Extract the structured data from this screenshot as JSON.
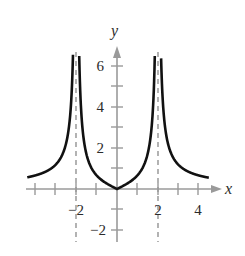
{
  "chart_data": {
    "type": "line",
    "title": "",
    "xlabel": "x",
    "ylabel": "y",
    "xlim": [
      -4.5,
      4.8
    ],
    "ylim": [
      -2.5,
      7
    ],
    "x_ticks": [
      -4,
      -3,
      -2,
      -1,
      1,
      2,
      3,
      4
    ],
    "x_tick_labels": [
      "-2",
      "2",
      "4"
    ],
    "x_tick_label_values": [
      -2,
      2,
      4
    ],
    "y_ticks": [
      -2,
      -1,
      1,
      2,
      3,
      4,
      5,
      6
    ],
    "y_tick_labels": [
      "6",
      "4",
      "2",
      "-2"
    ],
    "y_tick_label_values": [
      6,
      4,
      2,
      -2
    ],
    "grid": false,
    "legend": null,
    "asymptotes": [
      {
        "type": "vertical",
        "x": -2,
        "style": "dashed"
      },
      {
        "type": "vertical",
        "x": 2,
        "style": "dashed"
      }
    ],
    "series": [
      {
        "name": "f(x)",
        "description": "even function with cusp at origin, vertical asymptotes at x = ±2, approaching 0 as |x| grows",
        "approx_formula": "2|x| / |x^2 - 4|",
        "points": [
          [
            -4.4,
            0.6
          ],
          [
            -4.0,
            0.67
          ],
          [
            -3.5,
            0.85
          ],
          [
            -3.0,
            1.2
          ],
          [
            -2.6,
            1.9
          ],
          [
            -2.3,
            3.4
          ],
          [
            -2.15,
            6.6
          ],
          [
            -1.85,
            6.6
          ],
          [
            -1.7,
            4.3
          ],
          [
            -1.5,
            1.7
          ],
          [
            -1.0,
            0.67
          ],
          [
            -0.5,
            0.27
          ],
          [
            0,
            0
          ],
          [
            0.5,
            0.27
          ],
          [
            1.0,
            0.67
          ],
          [
            1.5,
            1.7
          ],
          [
            1.7,
            4.3
          ],
          [
            1.85,
            6.6
          ],
          [
            2.15,
            6.6
          ],
          [
            2.3,
            3.4
          ],
          [
            2.6,
            1.9
          ],
          [
            3.0,
            1.2
          ],
          [
            3.5,
            0.85
          ],
          [
            4.0,
            0.67
          ],
          [
            4.5,
            0.6
          ]
        ]
      }
    ]
  },
  "labels": {
    "x_axis": "x",
    "y_axis": "y",
    "xtick_neg2": "−2",
    "xtick_2": "2",
    "xtick_4": "4",
    "ytick_6": "6",
    "ytick_4": "4",
    "ytick_2": "2",
    "ytick_neg2": "−2"
  },
  "colors": {
    "curve": "#111111",
    "axis": "#9a9a9a",
    "asymptote": "#8a8a8a",
    "text": "#2b2b2b"
  }
}
